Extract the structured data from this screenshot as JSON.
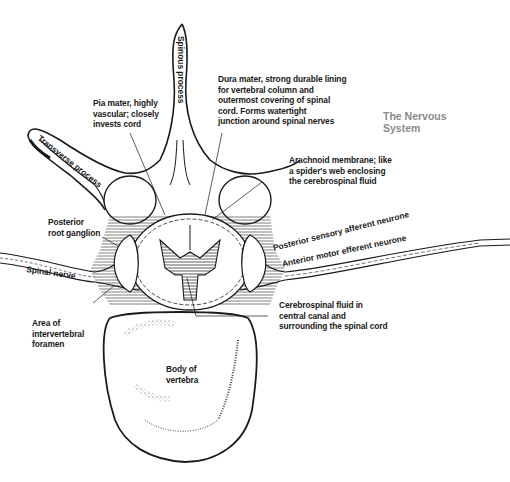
{
  "title": {
    "line1": "The Nervous",
    "line2": "System"
  },
  "labels": {
    "spinous_process": "Spinous process",
    "transverse_process": "Transverse process",
    "pia_mater": [
      "Pia mater, highly",
      "vascular; closely",
      "invests cord"
    ],
    "dura_mater": [
      "Dura mater, strong durable lining",
      "for vertebral column and",
      "outermost covering of spinal",
      "cord. Forms watertight",
      "junction around spinal nerves"
    ],
    "arachnoid": [
      "Arachnoid membrane; like",
      "a spider's web enclosing",
      "the cerebrospinal fluid"
    ],
    "posterior_root_ganglion": [
      "Posterior",
      "root ganglion"
    ],
    "spinal_nerve": "Spinal nerve",
    "posterior_sensory": "Posterior sensory afferent neurone",
    "anterior_motor": "Anterior motor efferent neurone",
    "csf": [
      "Cerebrospinal fluid in",
      "central canal and",
      "surrounding the spinal cord"
    ],
    "intervertebral_foramen": [
      "Area of",
      "intervertebral",
      "foramen"
    ],
    "body_of_vertebra": [
      "Body of",
      "vertebra"
    ]
  },
  "colors": {
    "ink": "#1a1a1a",
    "title": "#8a8a8a",
    "hatch": "#555555",
    "background": "#ffffff"
  }
}
